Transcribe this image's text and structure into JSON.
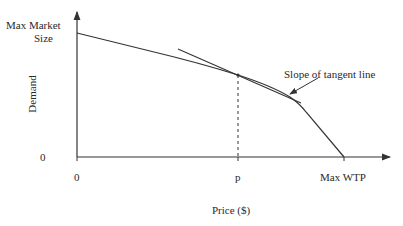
{
  "diagram": {
    "type": "demand-curve",
    "y_axis": {
      "label": "Demand",
      "top_label_line1": "Max Market",
      "top_label_line2": "Size",
      "zero_label": "0"
    },
    "x_axis": {
      "label": "Price ($)",
      "zero_label": "0",
      "p_label": "p",
      "max_label": "Max WTP"
    },
    "annotation": {
      "tangent_label": "Slope of tangent line"
    },
    "colors": {
      "line": "#333333",
      "background": "#ffffff"
    }
  }
}
